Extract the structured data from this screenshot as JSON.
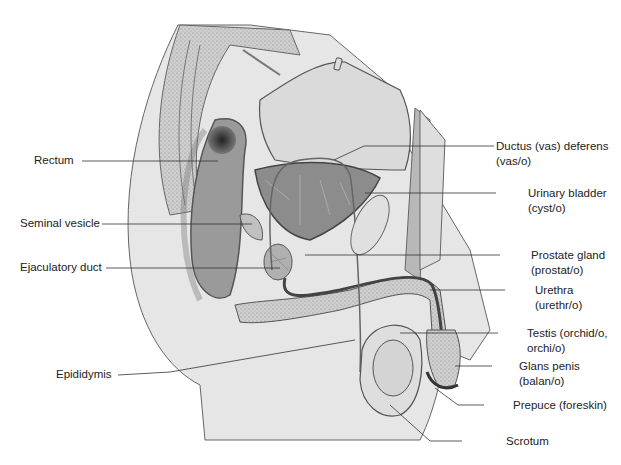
{
  "figure": {
    "colors": {
      "skin": "#e4e4e4",
      "tissue": "#cfcfcf",
      "dark": "#6f6f6f",
      "outline": "#555555",
      "leader": "#333333"
    }
  },
  "labels": {
    "left": [
      {
        "id": "rectum",
        "lines": [
          "Rectum"
        ]
      },
      {
        "id": "seminal-vesicle",
        "lines": [
          "Seminal vesicle"
        ]
      },
      {
        "id": "ejaculatory-duct",
        "lines": [
          "Ejaculatory duct"
        ]
      },
      {
        "id": "epididymis",
        "lines": [
          "Epididymis"
        ]
      }
    ],
    "right": [
      {
        "id": "ductus-deferens",
        "lines": [
          "Ductus (vas) deferens",
          "(vas/o)"
        ]
      },
      {
        "id": "urinary-bladder",
        "lines": [
          "Urinary bladder",
          "(cyst/o)"
        ]
      },
      {
        "id": "prostate-gland",
        "lines": [
          "Prostate gland",
          "(prostat/o)"
        ]
      },
      {
        "id": "urethra",
        "lines": [
          "Urethra",
          "(urethr/o)"
        ]
      },
      {
        "id": "testis",
        "lines": [
          "Testis (orchid/o,",
          "orchi/o)"
        ]
      },
      {
        "id": "glans-penis",
        "lines": [
          "Glans penis",
          "(balan/o)"
        ]
      },
      {
        "id": "prepuce",
        "lines": [
          "Prepuce (foreskin)"
        ]
      },
      {
        "id": "scrotum",
        "lines": [
          "Scrotum"
        ]
      }
    ]
  }
}
